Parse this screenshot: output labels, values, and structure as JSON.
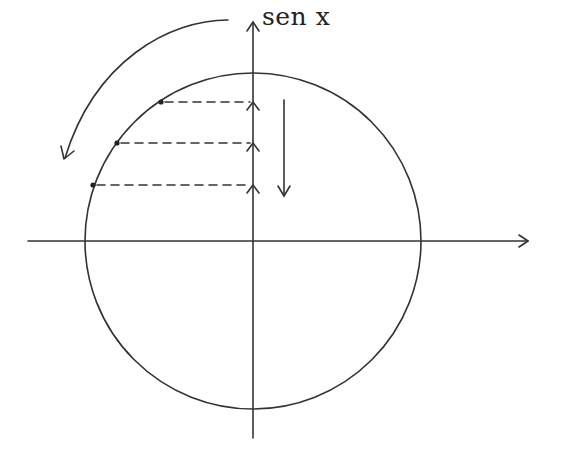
{
  "diagram": {
    "y_axis_label": "sen x",
    "colors": {
      "stroke": "#333333",
      "background": "#ffffff"
    },
    "circle": {
      "cx": 253,
      "cy": 241,
      "r": 168
    },
    "x_axis": {
      "y": 241,
      "x1": 28,
      "x2": 528,
      "arrow": "right"
    },
    "y_axis": {
      "x": 253,
      "y1": 438,
      "y2": 30,
      "arrow": "up"
    },
    "points": [
      {
        "x": 161,
        "y": 102,
        "projection_y": 102
      },
      {
        "x": 117,
        "y": 143,
        "projection_y": 143
      },
      {
        "x": 93,
        "y": 185,
        "projection_y": 185
      }
    ],
    "rotation_arrow": {
      "direction": "counterclockwise"
    },
    "decrease_arrow": {
      "x": 284,
      "y1": 100,
      "y2": 196,
      "direction": "down"
    }
  }
}
